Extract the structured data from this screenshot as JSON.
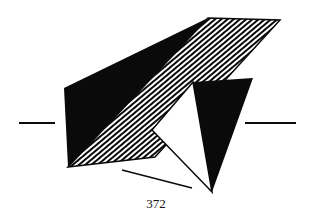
{
  "figure": {
    "page_number": "372",
    "colors": {
      "ink": "#0a0a0a",
      "paper": "#ffffff"
    }
  }
}
